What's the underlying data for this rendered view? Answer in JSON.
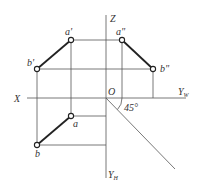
{
  "diagram": {
    "type": "orthographic-projection",
    "axes": {
      "origin_label": "O",
      "x_label": "X",
      "z_label": "Z",
      "yw_label": "Y",
      "yw_sub": "W",
      "yh_label": "Y",
      "yh_sub": "H",
      "angle_label": "45°"
    },
    "points": {
      "a_front": "a'",
      "b_front": "b'",
      "a_side": "a\"",
      "b_side": "b\"",
      "a_top": "a",
      "b_top": "b"
    },
    "colors": {
      "line": "#555555",
      "segment": "#222222",
      "background": "#ffffff"
    }
  }
}
